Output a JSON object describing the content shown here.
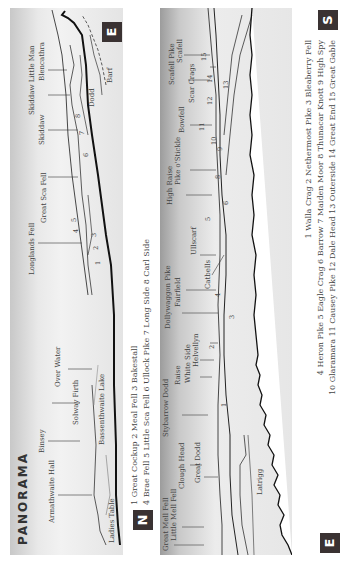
{
  "title": "PANORAMA",
  "badges": {
    "north": "N",
    "east_top": "E",
    "south": "S",
    "east_bottom": "E"
  },
  "top_panel": {
    "labels": [
      "Armathwaite Hall",
      "Binsey",
      "Solway Firth",
      "Bassenthwaite Lake",
      "Ladies Table",
      "Over Water",
      "Longlands Fell",
      "Great Sca Fell",
      "Skiddaw",
      "Skiddaw Little Man",
      "Blencathra",
      "Dodd",
      "Barf"
    ],
    "numbers": [
      "1",
      "2",
      "3",
      "4",
      "5",
      "6",
      "7",
      "8"
    ]
  },
  "top_caption": {
    "line1": "1 Great Cockup  2 Meal Fell  3 Bakestall",
    "line2": "4 Brae Fell  5 Little Sca Fell 6 Ullock Pike  7 Long Side  8 Carl Side"
  },
  "bottom_panel": {
    "labels": [
      "Great Mell Fell",
      "Little Mell Fell",
      "Clough Head",
      "Great Dodd",
      "Stybarrow Dodd",
      "Raise",
      "White Side",
      "Helvellyn",
      "Dollywaggon Pike",
      "Fairfield",
      "Catbells",
      "Ullscarf",
      "High Raise",
      "Pike o'Stickle",
      "Bowfell",
      "Scar Crags",
      "Scafell Pike",
      "Scafell",
      "Latrigg"
    ],
    "numbers": [
      "1",
      "2",
      "3",
      "4",
      "5",
      "6",
      "8",
      "9",
      "10",
      "11",
      "12",
      "13",
      "14",
      "15"
    ]
  },
  "bottom_caption": {
    "line1": "1 Walla Crag  2 Nethermost Pike  3 Bleaberry Fell",
    "line2": "4 Heron Pike  5 Eagle Crag  6 Barrow  7 Maiden Moor  8 Thunacar Knott  9 High Spy",
    "line3": "10 Glaramara  11 Causey Pike  12 Dale Head  13 Outerside  14 Great End  15 Great Gable"
  },
  "colors": {
    "badge": "#3a3232",
    "line": "#222222",
    "panel_light": "#f2f2f2",
    "panel_dark": "#9c9c9c"
  }
}
